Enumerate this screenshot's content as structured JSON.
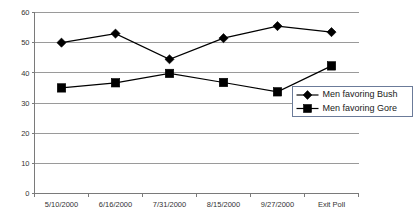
{
  "chart_data": {
    "type": "line",
    "title": "",
    "xlabel": "",
    "ylabel": "",
    "categories": [
      "5/10/2000",
      "6/16/2000",
      "7/31/2000",
      "8/15/2000",
      "9/27/2000",
      "Exit Poll"
    ],
    "series": [
      {
        "name": "Men favoring Bush",
        "marker": "diamond",
        "color": "#000000",
        "values": [
          50,
          53,
          44.5,
          51.5,
          55.5,
          53.5
        ]
      },
      {
        "name": "Men favoring Gore",
        "marker": "square",
        "color": "#000000",
        "values": [
          35,
          36.7,
          39.8,
          36.8,
          33.7,
          42.3
        ]
      }
    ],
    "ylim": [
      0,
      60
    ],
    "ytick_values": [
      0,
      10,
      20,
      30,
      40,
      50,
      60
    ],
    "ytick_labels": [
      "0",
      "10",
      "20",
      "30",
      "40",
      "50",
      "60"
    ],
    "grid": true,
    "grid_axis": "y",
    "legend_position": "lower-right",
    "legend_entries": [
      "Men favoring Bush",
      "Men favoring Gore"
    ],
    "colors": {
      "gridline": "#9a9a9a",
      "axis": "#7a7a7a",
      "series": "#000000",
      "legend_border": "#6b7b99",
      "background": "#ffffff",
      "tick_text": "#333333"
    }
  }
}
